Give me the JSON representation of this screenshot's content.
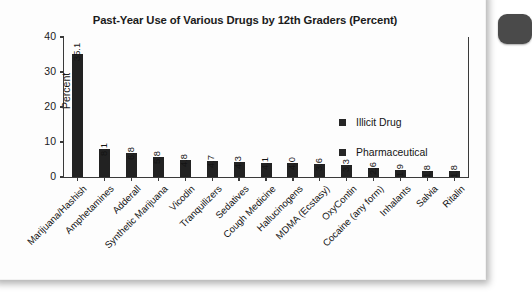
{
  "card": {
    "edge_tab": "page-edge-tab",
    "accent_color": "#4a4a4a",
    "bar_color": "#222222",
    "axis_color": "#3a3a3a",
    "background": "#fdfdfd"
  },
  "chart_data": {
    "type": "bar",
    "title": "Past-Year Use of Various Drugs by 12th Graders (Percent)",
    "xlabel": "",
    "ylabel": "Percent",
    "ylim": [
      0,
      40
    ],
    "yticks": [
      0,
      10,
      20,
      30,
      40
    ],
    "grid": false,
    "legend_position": "inside-upper-right",
    "legend": [
      "Illicit Drug",
      "Pharmaceutical"
    ],
    "categories": [
      "Marijuana/Hashish",
      "Amphetamines",
      "Adderall",
      "Synthetic Marijuana",
      "Vicodin",
      "Tranquilizers",
      "Sedatives",
      "Cough Medicine",
      "Hallucinogens",
      "MDMA (Ecstasy)",
      "OxyContin",
      "Cocaine (any form)",
      "Inhalants",
      "Salvia",
      "Ritalin"
    ],
    "values": [
      35.1,
      8.1,
      6.8,
      5.8,
      4.8,
      4.7,
      4.3,
      4.1,
      4.0,
      3.6,
      3.3,
      2.6,
      1.9,
      1.8,
      1.8
    ],
    "value_labels": [
      "35.1",
      "8.1",
      "6.8",
      "5.8",
      "4.8",
      "4.7",
      "4.3",
      "4.1",
      "4.0",
      "3.6",
      "3.3",
      "2.6",
      "1.9",
      "1.8",
      "1.8"
    ]
  }
}
